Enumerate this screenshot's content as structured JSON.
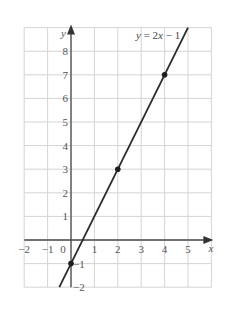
{
  "chart_data": {
    "type": "line",
    "title": "",
    "xlabel": "x",
    "ylabel": "y",
    "xlim": [
      -2,
      6
    ],
    "ylim": [
      -2,
      9
    ],
    "grid": true,
    "x_ticks": [
      "−2",
      "−1",
      "0",
      "1",
      "2",
      "3",
      "4",
      "5"
    ],
    "y_ticks": [
      "−2",
      "−1",
      "1",
      "2",
      "3",
      "4",
      "5",
      "6",
      "7",
      "8"
    ],
    "series": [
      {
        "name": "y = 2x − 1",
        "equation": "y = 2x − 1",
        "slope": 2,
        "intercept": -1,
        "line_range_x": [
          -0.5,
          5.0
        ],
        "marked_points": [
          {
            "x": 0,
            "y": -1
          },
          {
            "x": 2,
            "y": 3
          },
          {
            "x": 4,
            "y": 7
          }
        ]
      }
    ],
    "annotations": [
      {
        "text": "y = 2x − 1",
        "position": "top-right"
      }
    ]
  },
  "labels": {
    "x_axis": "x",
    "y_axis": "y",
    "equation_y": "y",
    "equation_eq": " = 2",
    "equation_x": "x",
    "equation_rest": " − 1"
  }
}
